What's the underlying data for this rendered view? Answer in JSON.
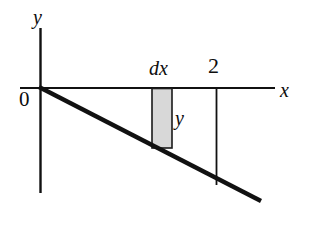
{
  "figure": {
    "background_color": "#ffffff",
    "ink_color": "#111111",
    "strip_fill_color": "#d8d8d8",
    "strip_stroke_color": "#1a1a1a",
    "labels": {
      "y_axis": "y",
      "x_axis": "x",
      "origin": "0",
      "strip_width": "dx",
      "strip_height": "y",
      "x_mark": "2"
    },
    "geometry": {
      "origin": {
        "x": 40,
        "y": 88
      },
      "x_axis": {
        "x1": 20,
        "y1": 88,
        "x2": 275,
        "y2": 88
      },
      "y_axis": {
        "x1": 40,
        "y1": 28,
        "x2": 40,
        "y2": 193
      },
      "diagonal_line": {
        "x1": 40,
        "y1": 88,
        "x2": 260,
        "y2": 200
      },
      "strip_rect": {
        "x": 152,
        "y": 88,
        "width": 20,
        "height": 60
      },
      "vertical_at_two": {
        "x1": 216,
        "y1": 88,
        "x2": 216,
        "y2": 185
      }
    }
  }
}
